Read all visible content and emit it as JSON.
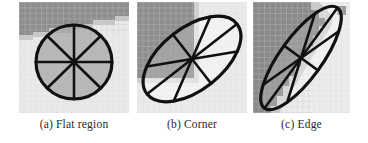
{
  "figure": {
    "type": "image-figure",
    "background": "#ffffff",
    "panel_count": 3
  },
  "panels": [
    {
      "id": "flat-region",
      "tag": "(a)",
      "label": "Flat region",
      "caption": "(a) Flat region",
      "shape": "circle",
      "shape_description": "isotropic circle divided into 8 sectors by radial spokes",
      "spokes": 8,
      "ellipse": {
        "cx": 55,
        "cy": 60,
        "rx": 38,
        "ry": 37,
        "rotation_deg": 0,
        "stroke": "#111111",
        "stroke_width": 3.2,
        "fill": "#8f8f8f",
        "fill_opacity": 0.55
      },
      "patch": {
        "base_color": "#e9e9e7",
        "dark_color": "#8e8e8e",
        "mid_color": "#c9c9c7",
        "structure": "horizontal dark band across top with stepped diagonal lower boundary"
      }
    },
    {
      "id": "corner",
      "tag": "(b)",
      "label": "Corner",
      "caption": "(b) Corner",
      "shape": "ellipse",
      "shape_description": "tilted ellipse divided into 8 sectors by radial spokes",
      "spokes": 8,
      "ellipse": {
        "cx": 55,
        "cy": 57,
        "rx": 57,
        "ry": 31,
        "rotation_deg": -38,
        "stroke": "#111111",
        "stroke_width": 3.2,
        "fill": "#9a9a9a",
        "fill_opacity": 0.28
      },
      "patch": {
        "base_color": "#eaeae8",
        "dark_color": "#8e8e8e",
        "mid_color": "#cfcfcd",
        "structure": "dark quadrant occupying upper-left corner, L-shaped step boundary"
      }
    },
    {
      "id": "edge",
      "tag": "(c)",
      "label": "Edge",
      "caption": "(c) Edge",
      "shape": "ellipse",
      "shape_description": "highly elongated ellipse aligned along the edge, divided into 8 sectors",
      "spokes": 8,
      "ellipse": {
        "cx": 48,
        "cy": 56,
        "rx": 62,
        "ry": 21,
        "rotation_deg": -54,
        "stroke": "#111111",
        "stroke_width": 3.2,
        "fill": "#9a9a9a",
        "fill_opacity": 0.3
      },
      "patch": {
        "base_color": "#ececea",
        "dark_color": "#8a8a8a",
        "mid_color": "#c8c8c6",
        "structure": "diagonal edge from lower-left to upper-right separating dark and light regions"
      }
    }
  ],
  "colors": {
    "page_background": "#ffffff",
    "stroke": "#111111",
    "dark_gray": "#8e8e8e",
    "light_gray": "#e9e9e7",
    "caption_text": "#2a2a2a",
    "grid_line": "#dcdcda"
  }
}
